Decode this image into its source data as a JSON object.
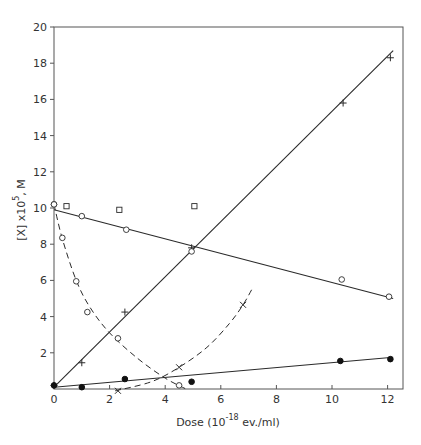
{
  "chart_data": {
    "type": "scatter",
    "title": "",
    "xlabel": "Dose (10^-18 ev./ml)",
    "xlabel_parts": {
      "prefix": "Dose (10",
      "sup": "-18",
      "suffix": " ev./ml)"
    },
    "ylabel": "[X] x10^5, M",
    "ylabel_parts": {
      "prefix": "[X] x10",
      "sup": "5",
      "suffix": ", M"
    },
    "xlim": [
      0,
      12.6
    ],
    "ylim": [
      0,
      20
    ],
    "x_ticks": [
      0,
      2,
      4,
      6,
      8,
      10,
      12
    ],
    "y_ticks": [
      2,
      4,
      6,
      8,
      10,
      12,
      14,
      16,
      18,
      20
    ],
    "x_tick_labels": [
      "0",
      "2",
      "4",
      "6",
      "8",
      "10",
      "12"
    ],
    "y_tick_labels": [
      "2",
      "4",
      "6",
      "8",
      "10",
      "12",
      "14",
      "16",
      "18",
      "20"
    ],
    "origin_label": "0",
    "grid": false,
    "legend": "none",
    "series": [
      {
        "name": "plus (solid rising line)",
        "marker": "plus",
        "points": [
          [
            0,
            0.2
          ],
          [
            1.0,
            1.45
          ],
          [
            2.55,
            4.25
          ],
          [
            4.95,
            7.8
          ],
          [
            10.4,
            15.8
          ],
          [
            12.1,
            18.3
          ]
        ],
        "fit_line": {
          "style": "solid",
          "from": [
            0,
            0.1
          ],
          "to": [
            12.2,
            18.7
          ]
        }
      },
      {
        "name": "open circle (solid falling line)",
        "marker": "circle-open",
        "points": [
          [
            0,
            10.2
          ],
          [
            1.0,
            9.55
          ],
          [
            2.6,
            8.8
          ],
          [
            4.95,
            7.6
          ],
          [
            10.35,
            6.05
          ],
          [
            12.05,
            5.1
          ]
        ],
        "fit_line": {
          "style": "solid",
          "from": [
            0,
            9.9
          ],
          "to": [
            12.2,
            5.0
          ]
        }
      },
      {
        "name": "open square",
        "marker": "square-open",
        "points": [
          [
            0.45,
            10.1
          ],
          [
            2.35,
            9.9
          ],
          [
            5.05,
            10.1
          ]
        ]
      },
      {
        "name": "open circle (dashed decay curve)",
        "marker": "circle-open",
        "points": [
          [
            0,
            10.2
          ],
          [
            0.3,
            8.35
          ],
          [
            0.8,
            5.95
          ],
          [
            1.2,
            4.25
          ],
          [
            2.3,
            2.8
          ],
          [
            4.5,
            0.2
          ]
        ],
        "curve": {
          "style": "dashed",
          "path": [
            [
              0,
              10.2
            ],
            [
              0.3,
              8.3
            ],
            [
              0.8,
              6.0
            ],
            [
              1.3,
              4.5
            ],
            [
              2.0,
              3.1
            ],
            [
              3.0,
              1.7
            ],
            [
              4.0,
              0.6
            ],
            [
              4.75,
              0.0
            ]
          ]
        }
      },
      {
        "name": "cross (dashed rising curve)",
        "marker": "cross",
        "points": [
          [
            2.3,
            -0.1
          ],
          [
            4.5,
            1.2
          ],
          [
            6.8,
            4.65
          ]
        ],
        "curve": {
          "style": "dashed",
          "path": [
            [
              2.2,
              -0.1
            ],
            [
              3.5,
              0.4
            ],
            [
              4.5,
              1.2
            ],
            [
              5.5,
              2.3
            ],
            [
              6.3,
              3.6
            ],
            [
              6.8,
              4.65
            ],
            [
              7.15,
              5.6
            ]
          ]
        }
      },
      {
        "name": "filled circle (solid low line)",
        "marker": "circle-filled",
        "points": [
          [
            0,
            0.2
          ],
          [
            1.0,
            0.1
          ],
          [
            2.55,
            0.55
          ],
          [
            4.95,
            0.4
          ],
          [
            10.3,
            1.55
          ],
          [
            12.1,
            1.65
          ]
        ],
        "fit_line": {
          "style": "solid",
          "from": [
            0,
            0.1
          ],
          "to": [
            12.2,
            1.75
          ]
        }
      }
    ]
  }
}
